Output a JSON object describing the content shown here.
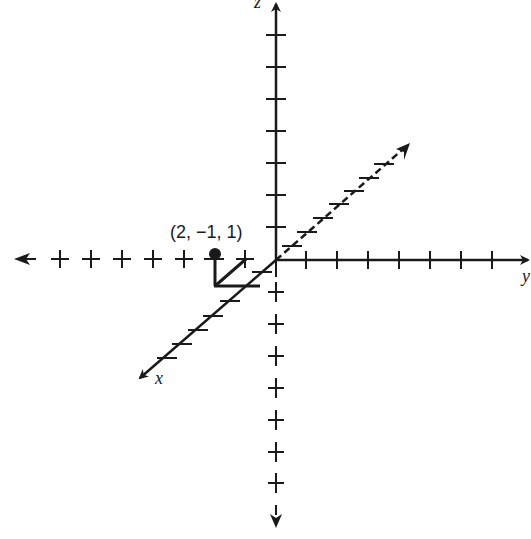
{
  "diagram": {
    "type": "3d-coordinate-axes",
    "axes": {
      "x": {
        "label": "x",
        "direction": "diagonal toward viewer (lower-left)",
        "negative_style": "dashed"
      },
      "y": {
        "label": "y",
        "direction": "right",
        "negative_style": "tick crosses only"
      },
      "z": {
        "label": "z",
        "direction": "up",
        "negative_style": "tick crosses only"
      }
    },
    "point": {
      "label": "(2, −1, 1)",
      "coords": [
        2,
        -1,
        1
      ]
    },
    "colors": {
      "ink": "#1a1a1a",
      "background": "#ffffff"
    }
  }
}
